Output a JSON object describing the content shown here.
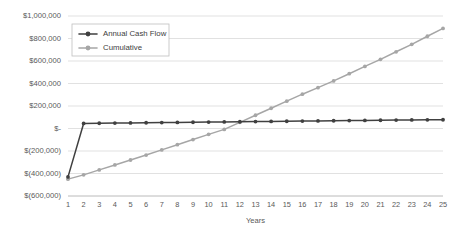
{
  "chart_data": {
    "type": "line",
    "title": "",
    "xlabel": "Years",
    "ylabel": "",
    "grid": true,
    "legend_position": "top-left-inside",
    "x": [
      1,
      2,
      3,
      4,
      5,
      6,
      7,
      8,
      9,
      10,
      11,
      12,
      13,
      14,
      15,
      16,
      17,
      18,
      19,
      20,
      21,
      22,
      23,
      24,
      25
    ],
    "categories": [
      "1",
      "2",
      "3",
      "4",
      "5",
      "6",
      "7",
      "8",
      "9",
      "10",
      "11",
      "12",
      "13",
      "14",
      "15",
      "16",
      "17",
      "18",
      "19",
      "20",
      "21",
      "22",
      "23",
      "24",
      "25"
    ],
    "xlim": [
      1,
      25
    ],
    "ylim": [
      -600000,
      1000000
    ],
    "ytick_values": [
      1000000,
      800000,
      600000,
      400000,
      200000,
      0,
      -200000,
      -400000,
      -600000
    ],
    "ytick_labels": [
      "$1,000,000",
      "$800,000",
      "$600,000",
      "$400,000",
      "$200,000",
      "$-",
      "$(200,000)",
      "$(400,000)",
      "$(600,000)"
    ],
    "series": [
      {
        "name": "Annual Cash Flow",
        "color": "#404040",
        "marker": "circle",
        "values": [
          -430000,
          45000,
          46500,
          48000,
          49500,
          51000,
          52500,
          54000,
          55500,
          57000,
          58500,
          60000,
          61500,
          63000,
          64500,
          66000,
          67500,
          69000,
          70500,
          72000,
          73500,
          75000,
          76000,
          77000,
          78000
        ]
      },
      {
        "name": "Cumulative",
        "color": "#a6a6a6",
        "marker": "circle",
        "values": [
          -450000,
          -412000,
          -368000,
          -324000,
          -280000,
          -236000,
          -190000,
          -144000,
          -98000,
          -52000,
          -8000,
          55000,
          118000,
          180000,
          243000,
          305000,
          363000,
          423000,
          487000,
          552000,
          615000,
          682000,
          748000,
          820000,
          890000
        ]
      }
    ]
  }
}
